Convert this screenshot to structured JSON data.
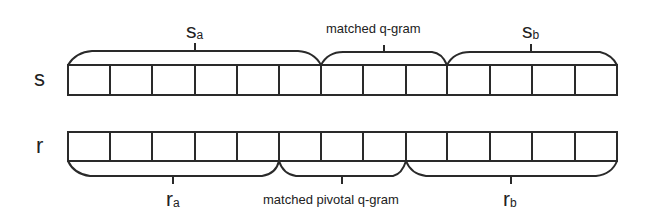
{
  "diagram": {
    "title": "",
    "rows": [
      {
        "id": "s",
        "label": "s",
        "cells": 13
      },
      {
        "id": "r",
        "label": "r",
        "cells": 13
      }
    ],
    "braces": {
      "s_a": {
        "main": "s",
        "sub": "a",
        "from_cell": 0,
        "to_cell": 6
      },
      "s_match": {
        "text": "matched q-gram",
        "from_cell": 6,
        "to_cell": 9
      },
      "s_b": {
        "main": "s",
        "sub": "b",
        "from_cell": 9,
        "to_cell": 13
      },
      "r_a": {
        "main": "r",
        "sub": "a",
        "from_cell": 0,
        "to_cell": 5
      },
      "r_match": {
        "text": "matched pivotal q-gram",
        "from_cell": 5,
        "to_cell": 8
      },
      "r_b": {
        "main": "r",
        "sub": "b",
        "from_cell": 8,
        "to_cell": 13
      }
    },
    "colors": {
      "stroke": "#2a2a2a",
      "background": "#ffffff"
    }
  }
}
